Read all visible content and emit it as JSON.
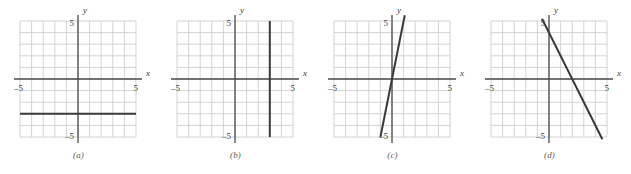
{
  "figure": {
    "background_color": "#ffffff",
    "grid_color": "#c9c9c9",
    "axis_color": "#4a4a4a",
    "line_color": "#3a3a3a",
    "text_color": "#3c3c3c",
    "panel_count": 4
  },
  "panels": [
    {
      "caption": "(a)",
      "axis_labels": {
        "x": "x",
        "y": "y"
      },
      "tick_labels": {
        "x_min": "–5",
        "x_max": "5",
        "y_max": "5",
        "y_min": "–5"
      },
      "graph_description": "horizontal line"
    },
    {
      "caption": "(b)",
      "axis_labels": {
        "x": "x",
        "y": "y"
      },
      "tick_labels": {
        "x_min": "–5",
        "x_max": "5",
        "y_max": "5",
        "y_min": "–5"
      },
      "graph_description": "vertical line"
    },
    {
      "caption": "(c)",
      "axis_labels": {
        "x": "x",
        "y": "y"
      },
      "tick_labels": {
        "x_min": "–5",
        "x_max": "5",
        "y_max": "5",
        "y_min": "–5"
      },
      "graph_description": "steep increasing line through origin"
    },
    {
      "caption": "(d)",
      "axis_labels": {
        "x": "x",
        "y": "y"
      },
      "tick_labels": {
        "x_min": "–5",
        "x_max": "5",
        "y_max": "5",
        "y_min": "–5"
      },
      "graph_description": "decreasing line"
    }
  ],
  "chart_data": [
    {
      "type": "line",
      "title": "(a)",
      "xlabel": "x",
      "ylabel": "y",
      "xlim": [
        -5,
        5
      ],
      "ylim": [
        -5,
        5
      ],
      "grid": true,
      "x_ticks": [
        -5,
        5
      ],
      "y_ticks": [
        -5,
        5
      ],
      "series": [
        {
          "name": "y = -3",
          "slope": 0,
          "intercept": -3,
          "points": [
            [
              -5,
              -3
            ],
            [
              5,
              -3
            ]
          ]
        }
      ]
    },
    {
      "type": "line",
      "title": "(b)",
      "xlabel": "x",
      "ylabel": "y",
      "xlim": [
        -5,
        5
      ],
      "ylim": [
        -5,
        5
      ],
      "grid": true,
      "x_ticks": [
        -5,
        5
      ],
      "y_ticks": [
        -5,
        5
      ],
      "series": [
        {
          "name": "x = 3",
          "slope": null,
          "intercept": null,
          "points": [
            [
              3,
              5
            ],
            [
              3,
              -5
            ]
          ]
        }
      ]
    },
    {
      "type": "line",
      "title": "(c)",
      "xlabel": "x",
      "ylabel": "y",
      "xlim": [
        -5,
        5
      ],
      "ylim": [
        -5,
        5
      ],
      "grid": true,
      "x_ticks": [
        -5,
        5
      ],
      "y_ticks": [
        -5,
        5
      ],
      "series": [
        {
          "name": "y = 5x",
          "slope": 5,
          "intercept": 0,
          "points": [
            [
              -1,
              -5
            ],
            [
              1.1,
              5.5
            ]
          ]
        }
      ]
    },
    {
      "type": "line",
      "title": "(d)",
      "xlabel": "x",
      "ylabel": "y",
      "xlim": [
        -5,
        5
      ],
      "ylim": [
        -5,
        5
      ],
      "grid": true,
      "x_ticks": [
        -5,
        5
      ],
      "y_ticks": [
        -5,
        5
      ],
      "series": [
        {
          "name": "y = -2x + 4",
          "slope": -2,
          "intercept": 4,
          "points": [
            [
              -0.6,
              5.2
            ],
            [
              4.6,
              -5.2
            ]
          ]
        }
      ]
    }
  ]
}
